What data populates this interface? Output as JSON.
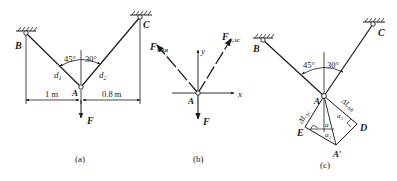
{
  "figure": {
    "panels": [
      {
        "id": "a",
        "caption": "(a)",
        "points": {
          "B": "B",
          "C": "C",
          "A": "A"
        },
        "angles": {
          "left": "45°",
          "right": "30°"
        },
        "distances": {
          "d1": "d",
          "d1_sub": "1",
          "d2": "d",
          "d2_sub": "2"
        },
        "dimensions": {
          "left": "1 m",
          "right": "0.8 m"
        },
        "force": "F"
      },
      {
        "id": "b",
        "caption": "(b)",
        "point": "A",
        "axes": {
          "x": "x",
          "y": "y"
        },
        "forces": {
          "ab": {
            "main": "F",
            "sub": "N,AB"
          },
          "ac": {
            "main": "F",
            "sub": "N,AC"
          },
          "load": "F"
        }
      },
      {
        "id": "c",
        "caption": "(c)",
        "points": {
          "B": "B",
          "C": "C",
          "A": "A",
          "E": "E",
          "D": "D",
          "A_prime": "A′"
        },
        "angles": {
          "left": "45°",
          "right": "30°",
          "alpha": "α",
          "alpha1": "α",
          "alpha1_sub": "1",
          "alpha2": "α",
          "alpha2_sub": "2"
        },
        "elongations": {
          "ac": {
            "main": "ΔL",
            "sub": "AC"
          },
          "ab": {
            "main": "ΔL",
            "sub": "AB"
          }
        }
      }
    ]
  }
}
